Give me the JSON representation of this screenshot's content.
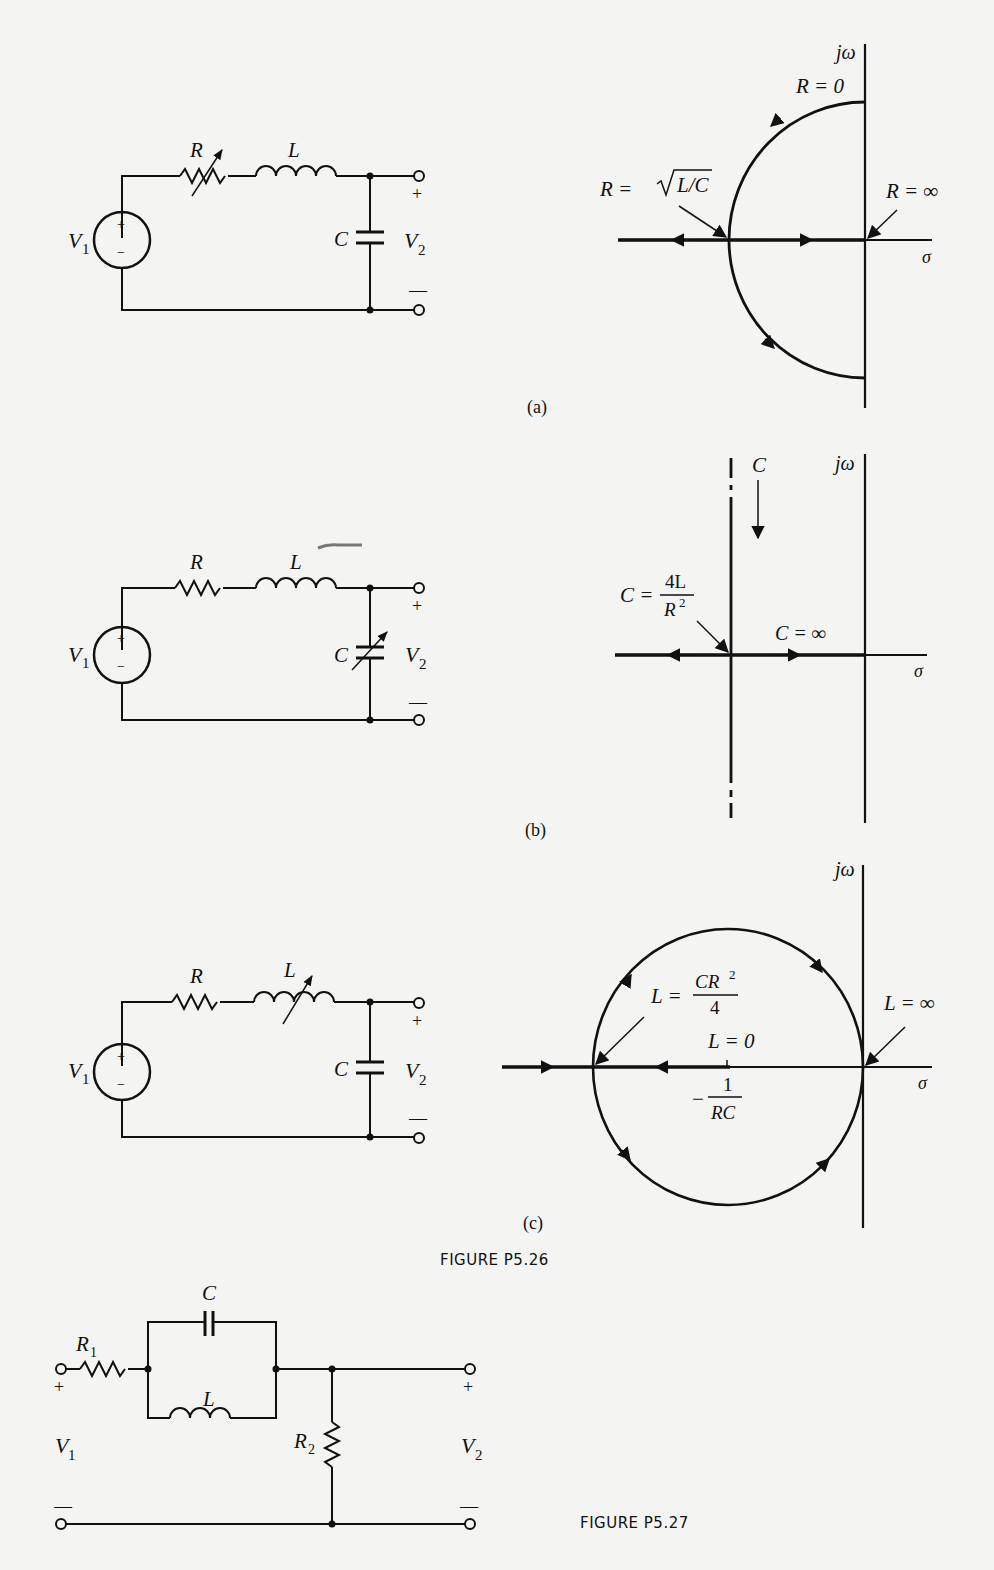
{
  "figure_p5_26": {
    "caption": "FIGURE P5.26",
    "subfigures": [
      {
        "label": "(a)",
        "circuit": {
          "source": "V",
          "source_sub": "1",
          "plus": "+",
          "minus": "−",
          "elements": [
            "R (variable)",
            "L",
            "C"
          ],
          "r_label": "R",
          "l_label": "L",
          "c_label": "C",
          "out": "V",
          "out_sub": "2",
          "out_plus": "+",
          "out_minus": "—"
        },
        "locus": {
          "jw": "jω",
          "sigma": "σ",
          "r_zero": "R = 0",
          "r_crit_pre": "R = ",
          "r_crit_rad": "L/C",
          "r_inf": "R = ∞"
        }
      },
      {
        "label": "(b)",
        "circuit": {
          "source": "V",
          "source_sub": "1",
          "plus": "+",
          "minus": "−",
          "elements": [
            "R",
            "L",
            "C (variable)"
          ],
          "r_label": "R",
          "l_label": "L",
          "c_label": "C",
          "out": "V",
          "out_sub": "2",
          "out_plus": "+",
          "out_minus": "—"
        },
        "locus": {
          "jw": "jω",
          "sigma": "σ",
          "c_dir": "C",
          "c_crit_pre": "C =",
          "c_crit_num": "4L",
          "c_crit_den": "R",
          "c_crit_den_sup": "2",
          "c_inf": "C = ∞"
        }
      },
      {
        "label": "(c)",
        "circuit": {
          "source": "V",
          "source_sub": "1",
          "plus": "+",
          "minus": "−",
          "elements": [
            "R",
            "L (variable)",
            "C"
          ],
          "r_label": "R",
          "l_label": "L",
          "c_label": "C",
          "out": "V",
          "out_sub": "2",
          "out_plus": "+",
          "out_minus": "—"
        },
        "locus": {
          "jw": "jω",
          "sigma": "σ",
          "l_crit_pre": "L =",
          "l_crit_num": "CR",
          "l_crit_num_sup": "2",
          "l_crit_den": "4",
          "l_zero": "L = 0",
          "l_inf": "L = ∞",
          "point_neg": "−",
          "point_num": "1",
          "point_den": "RC"
        }
      }
    ]
  },
  "figure_p5_27": {
    "caption": "FIGURE P5.27",
    "r1": "R",
    "r1_sub": "1",
    "c": "C",
    "l": "L",
    "r2": "R",
    "r2_sub": "2",
    "v1": "V",
    "v1_sub": "1",
    "v2": "V",
    "v2_sub": "2",
    "plus": "+",
    "minus": "—"
  }
}
